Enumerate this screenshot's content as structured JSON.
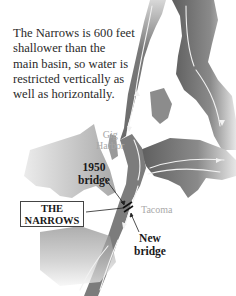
{
  "caption": {
    "lines": [
      "The Narrows is 600 feet",
      "shallower than the",
      "main basin, so water is",
      "restricted vertically as",
      "well as horizontally."
    ]
  },
  "places": {
    "gig_harbor": [
      "Gig",
      "Harbor"
    ],
    "tacoma": "Tacoma"
  },
  "callouts": {
    "bridge_1950": [
      "1950",
      "bridge"
    ],
    "new_bridge": [
      "New",
      "bridge"
    ],
    "the_narrows": [
      "THE",
      "NARROWS"
    ]
  },
  "colors": {
    "water": "#6e6e6e",
    "water_light": "#bdbdbd",
    "land": "#ffffff",
    "flow_arrows": "#f2f2f2",
    "label_gray": "#a9a9a9",
    "text": "#2b2b2b"
  },
  "icons": {
    "flow_arrow": "flow-arrow-icon",
    "bridge_marker": "bridge-icon"
  }
}
